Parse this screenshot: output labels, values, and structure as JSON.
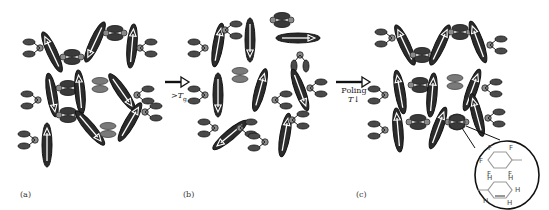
{
  "figure": {
    "panels": [
      {
        "id": "a",
        "label": "(a)",
        "description": "random chromophore orientation below Tg"
      },
      {
        "id": "b",
        "label": "(b)",
        "description": "mobile chromophores above Tg"
      },
      {
        "id": "c",
        "label": "(c)",
        "description": "poled aligned lattice with inset"
      }
    ],
    "transitions": [
      {
        "from": "a",
        "to": "b",
        "label_prefix": ">",
        "label_var": "T",
        "label_sub": "g"
      },
      {
        "from": "b",
        "to": "c",
        "label_line1": "Poling",
        "label_var": "T",
        "label_arrow": "↓"
      }
    ],
    "inset": {
      "top_ring_atoms": [
        "F",
        "F",
        "F",
        "F",
        "F"
      ],
      "bottom_ring_atoms": [
        "H",
        "H",
        "H",
        "H",
        "H"
      ],
      "top_ring_color": "#9a9a9a",
      "bottom_ring_color": "#9a9a9a"
    },
    "colors": {
      "chromophore_fill": "#2b2b2b",
      "chromophore_arrow": "#ffffff",
      "dendron_fill": "#4a4a4a",
      "dendron_light": "#7a7a7a",
      "node_fill": "#8a8a8a",
      "outline": "#111111"
    }
  }
}
